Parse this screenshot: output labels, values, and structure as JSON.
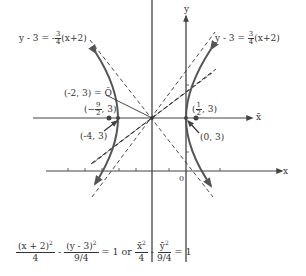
{
  "diagram": {
    "type": "hyperbola-graph",
    "axes": {
      "x_label": "x",
      "y_label": "y",
      "xbar_label": "x̄",
      "ybar_label": "ȳ",
      "origin_label": "0"
    },
    "center": {
      "label": "(-2, 3) = Ō",
      "x": -2,
      "y": 3
    },
    "points": [
      {
        "name": "left-focus",
        "label": "(-4, 3)",
        "x": -4,
        "y": 3
      },
      {
        "name": "left-vertex-label",
        "label": "(-9/2, 3)",
        "x": -4.5,
        "y": 3
      },
      {
        "name": "right-vertex",
        "label": "(0, 3)",
        "x": 0,
        "y": 3
      },
      {
        "name": "right-focus",
        "label": "(1/2, 3)",
        "x": 0.5,
        "y": 3
      }
    ],
    "asymptotes": [
      {
        "name": "asymptote-negative",
        "label_lhs": "y - 3 = -",
        "frac_num": "3",
        "frac_den": "4",
        "label_rhs": "(x+2)",
        "slope": -0.75
      },
      {
        "name": "asymptote-positive",
        "label_lhs": "y - 3 = ",
        "frac_num": "3",
        "frac_den": "4",
        "label_rhs": "(x+2)",
        "slope": 0.75
      }
    ],
    "equation": {
      "t1_num": "(x + 2)",
      "t1_exp": "2",
      "t1_den": "4",
      "minus1": "-",
      "t2_num": "(y - 3)",
      "t2_exp": "2",
      "t2_den": "9/4",
      "eq1": "= 1 or",
      "t3_num": "x̄",
      "t3_exp": "2",
      "t3_den": "4",
      "minus2": "-",
      "t4_num": "ȳ",
      "t4_exp": "2",
      "t4_den": "9/4",
      "eq2": "= 1"
    },
    "a": 2,
    "b": 1.5,
    "colors": {
      "line": "#333333",
      "curve": "#555555",
      "dashed": "#333333"
    }
  }
}
